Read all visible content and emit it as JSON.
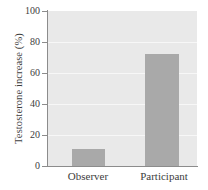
{
  "chart_data": {
    "type": "bar",
    "title": "",
    "xlabel": "",
    "ylabel": "Testosterone increase (%)",
    "categories": [
      "Observer",
      "Participant"
    ],
    "values": [
      11,
      72
    ],
    "ylim": [
      0,
      100
    ],
    "yticks": [
      0,
      20,
      40,
      60,
      80,
      100
    ],
    "ytick_labels": [
      "0",
      "20",
      "40",
      "60",
      "80",
      "100"
    ],
    "grid": true,
    "legend": null,
    "series": [
      {
        "name": "Testosterone increase",
        "values": [
          11,
          72
        ],
        "color": "#a9a9a9"
      }
    ],
    "colors": {
      "bar": "#a9a9a9",
      "plot_background": "#e9e9e9",
      "gridline": "#f7f7f7",
      "axis": "#8c8c8c",
      "text": "#3d3d3d",
      "figure_background": "#ffffff"
    }
  }
}
